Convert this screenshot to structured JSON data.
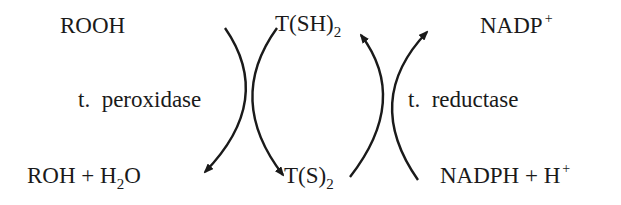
{
  "diagram": {
    "left_top": {
      "text": "ROOH"
    },
    "left_bottom": {
      "main": "ROH + H",
      "sub": "2",
      "tail": "O"
    },
    "center_top": {
      "main": "T(SH)",
      "sub": "2"
    },
    "center_bottom": {
      "main": "T(S)",
      "sub": "2"
    },
    "right_top": {
      "main": "NADP",
      "sup": "+"
    },
    "right_bottom": {
      "main": "NADPH + H",
      "sup": "+"
    },
    "enzyme_left": "t.  peroxidase",
    "enzyme_right": "t.  reductase",
    "colors": {
      "ink": "#1a1a1a",
      "background": "#ffffff"
    }
  }
}
